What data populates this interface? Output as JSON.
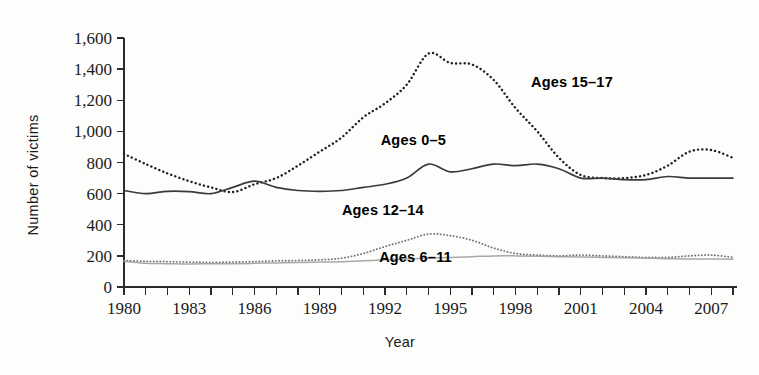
{
  "figure": {
    "background_color": "#fdfdfc",
    "ink_color": "#2b2b2b"
  },
  "axes": {
    "y_title": "Number of victims",
    "x_title": "Year",
    "y_ticks": [
      "0",
      "200",
      "400",
      "600",
      "800",
      "1,000",
      "1,200",
      "1,400",
      "1,600"
    ],
    "x_ticks_labeled": [
      "1980",
      "1983",
      "1986",
      "1989",
      "1992",
      "1995",
      "1998",
      "2001",
      "2004",
      "2007"
    ]
  },
  "series_labels": {
    "ages_15_17": "Ages 15–17",
    "ages_0_5": "Ages 0–5",
    "ages_12_14": "Ages 12–14",
    "ages_6_11": "Ages 6–11"
  },
  "chart_data": {
    "type": "line",
    "title": "",
    "xlabel": "Year",
    "ylabel": "Number of victims",
    "xlim": [
      1980,
      2008
    ],
    "ylim": [
      0,
      1600
    ],
    "ytick_step": 200,
    "xtick_step": 1,
    "xtick_label_step": 3,
    "grid": false,
    "legend": "inline-annotations",
    "x": [
      1980,
      1981,
      1982,
      1983,
      1984,
      1985,
      1986,
      1987,
      1988,
      1989,
      1990,
      1991,
      1992,
      1993,
      1994,
      1995,
      1996,
      1997,
      1998,
      1999,
      2000,
      2001,
      2002,
      2003,
      2004,
      2005,
      2006,
      2007,
      2008
    ],
    "series": [
      {
        "name": "Ages 15–17",
        "style": "dotted",
        "color": "#1f1f1f",
        "values": [
          855,
          790,
          730,
          680,
          640,
          610,
          660,
          700,
          780,
          870,
          960,
          1090,
          1180,
          1300,
          1500,
          1440,
          1430,
          1330,
          1150,
          1000,
          830,
          720,
          700,
          700,
          720,
          780,
          870,
          880,
          830
        ]
      },
      {
        "name": "Ages 0–5",
        "style": "solid",
        "color": "#3a3a3a",
        "values": [
          620,
          600,
          615,
          613,
          600,
          640,
          680,
          640,
          620,
          615,
          620,
          640,
          660,
          700,
          790,
          740,
          760,
          790,
          780,
          790,
          760,
          700,
          700,
          690,
          690,
          710,
          700,
          700,
          700
        ]
      },
      {
        "name": "Ages 12–14",
        "style": "dotted-light",
        "color": "#6a6a6a",
        "values": [
          170,
          165,
          163,
          160,
          158,
          160,
          163,
          168,
          170,
          175,
          185,
          215,
          260,
          300,
          340,
          330,
          300,
          250,
          215,
          205,
          200,
          205,
          200,
          195,
          190,
          190,
          200,
          205,
          190
        ]
      },
      {
        "name": "Ages 6–11",
        "style": "solid-light",
        "color": "#9a9a9a",
        "values": [
          165,
          152,
          150,
          148,
          150,
          150,
          152,
          155,
          158,
          160,
          162,
          168,
          175,
          180,
          185,
          190,
          195,
          200,
          200,
          198,
          195,
          192,
          190,
          188,
          185,
          182,
          180,
          180,
          178
        ]
      }
    ],
    "annotations": [
      {
        "text": "Ages 15–17",
        "x": 2000.6,
        "y": 1285
      },
      {
        "text": "Ages 0–5",
        "x": 1993.3,
        "y": 915
      },
      {
        "text": "Ages 12–14",
        "x": 1991.9,
        "y": 465
      },
      {
        "text": "Ages 6–11",
        "x": 1993.4,
        "y": 160
      }
    ]
  }
}
